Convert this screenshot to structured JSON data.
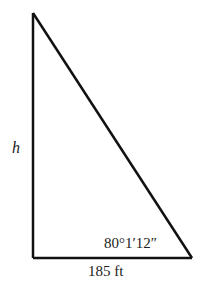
{
  "diagram": {
    "type": "right-triangle",
    "labels": {
      "height": "h",
      "base": "185 ft",
      "angle": "80°1′12″"
    },
    "vertices": {
      "top": [
        33,
        13
      ],
      "bottom_left": [
        33,
        258
      ],
      "bottom_right": [
        191,
        258
      ]
    },
    "stroke_color": "#111111"
  }
}
